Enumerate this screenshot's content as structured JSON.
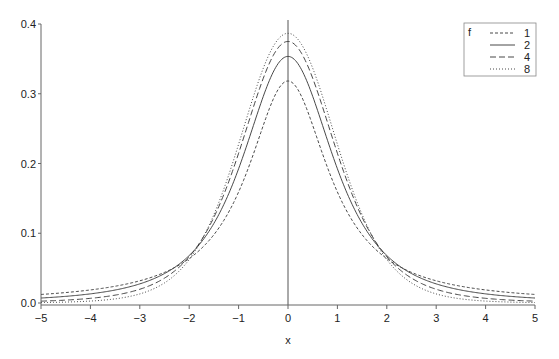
{
  "chart_data": {
    "type": "line",
    "title": "",
    "xlabel": "x",
    "ylabel": "",
    "xlim": [
      -5,
      5
    ],
    "ylim": [
      0,
      0.4
    ],
    "x_ticks": [
      "-5",
      "-4",
      "-3",
      "-2",
      "-1",
      "0",
      "1",
      "2",
      "3",
      "4",
      "5"
    ],
    "y_ticks": [
      "0.0",
      "0.1",
      "0.2",
      "0.3",
      "0.4"
    ],
    "grid": false,
    "vertical_reference_line_at_x": 0,
    "legend": {
      "title": "f",
      "position": "top-right",
      "entries": [
        {
          "label": "1",
          "style": "short-dash"
        },
        {
          "label": "2",
          "style": "solid"
        },
        {
          "label": "4",
          "style": "long-dash"
        },
        {
          "label": "8",
          "style": "dotted"
        }
      ]
    },
    "x": [
      -5,
      -4,
      -3,
      -2,
      -1,
      0,
      1,
      2,
      3,
      4,
      5
    ],
    "series": [
      {
        "name": "1",
        "dash": "3,2",
        "values": [
          0.0122,
          0.0187,
          0.0318,
          0.0637,
          0.1592,
          0.3183,
          0.1592,
          0.0637,
          0.0318,
          0.0187,
          0.0122
        ]
      },
      {
        "name": "2",
        "dash": "",
        "values": [
          0.0071,
          0.0131,
          0.0274,
          0.068,
          0.1925,
          0.3536,
          0.1925,
          0.068,
          0.0274,
          0.0131,
          0.0071
        ]
      },
      {
        "name": "4",
        "dash": "6,3",
        "values": [
          0.0042,
          0.0087,
          0.0216,
          0.0663,
          0.2147,
          0.375,
          0.2147,
          0.0663,
          0.0216,
          0.0087,
          0.0042
        ]
      },
      {
        "name": "8",
        "dash": "1,2",
        "values": [
          0.0019,
          0.0048,
          0.015,
          0.0612,
          0.2276,
          0.388,
          0.2276,
          0.0612,
          0.015,
          0.0048,
          0.0019
        ]
      }
    ],
    "dof": [
      1,
      2,
      4,
      8
    ]
  },
  "colors": {
    "line": "#333333",
    "axis": "#666666",
    "legend_border": "#888888"
  }
}
